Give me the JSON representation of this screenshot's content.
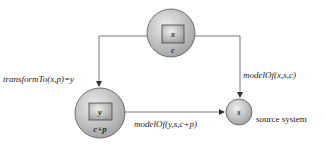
{
  "diagram": {
    "nodes": [
      {
        "id": "x",
        "inner_label": "x",
        "sub_label": "c",
        "cx": 171,
        "cy": 33,
        "r": 24
      },
      {
        "id": "y",
        "inner_label": "y",
        "sub_label": "c+p",
        "cx": 100,
        "cy": 113,
        "r": 25
      },
      {
        "id": "s",
        "inner_label": "s",
        "cx": 239,
        "cy": 112,
        "r": 13,
        "caption": "source system"
      }
    ],
    "edges": [
      {
        "from": "x",
        "to": "y",
        "label": "transformTo(x,p)=y"
      },
      {
        "from": "x",
        "to": "s",
        "label": "modelOf(x,s,c)"
      },
      {
        "from": "y",
        "to": "s",
        "label": "modelOf(y,s,c+p)"
      }
    ],
    "colors": {
      "node_fill_light": "#e8e8e8",
      "node_fill_dark": "#9a9a9a",
      "stroke": "#555555",
      "line": "#666666"
    }
  }
}
